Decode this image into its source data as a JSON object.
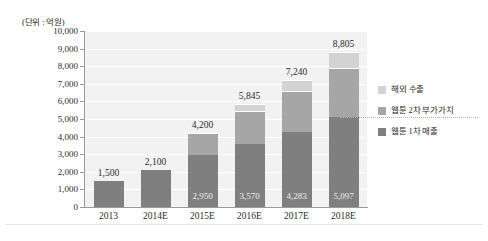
{
  "unit_label": "(단위 : 억원)",
  "chart_data": {
    "type": "bar",
    "subtype": "stacked-bar",
    "title": "",
    "subtitle": "",
    "xlabel": "",
    "ylabel": "",
    "unit_note": "(단위 : 억원)",
    "categories": [
      "2013",
      "2014E",
      "2015E",
      "2016E",
      "2017E",
      "2018E"
    ],
    "ylim": [
      0,
      10000
    ],
    "ytick_labels": [
      "10,000",
      "9,000",
      "8,000",
      "7,000",
      "6,000",
      "5,000",
      "4,000",
      "3,000",
      "2,000",
      "1,000",
      "0"
    ],
    "ytick_values": [
      10000,
      9000,
      8000,
      7000,
      6000,
      5000,
      4000,
      3000,
      2000,
      1000,
      0
    ],
    "grid": true,
    "grid_color": "#ffffff",
    "plot_background": "#f2f2f2",
    "legend_position": "right",
    "series": [
      {
        "name": "웹툰 1차 매출",
        "color": "#7f7f7f",
        "values": [
          1500,
          2100,
          2950,
          3570,
          4283,
          5097
        ],
        "value_labels": [
          "",
          "",
          "2,950",
          "3,570",
          "4,283",
          "5,097"
        ]
      },
      {
        "name": "웹툰 2차 부가가치",
        "color": "#a6a6a6",
        "values": [
          0,
          0,
          1250,
          1860,
          2307,
          2808
        ],
        "value_labels": [
          "",
          "",
          "",
          "",
          "",
          ""
        ]
      },
      {
        "name": "해외 수출",
        "color": "#d3d3d3",
        "values": [
          0,
          0,
          0,
          415,
          650,
          900
        ],
        "value_labels": [
          "",
          "",
          "",
          "",
          "",
          ""
        ]
      }
    ],
    "totals": [
      1500,
      2100,
      4200,
      5845,
      7240,
      8805
    ],
    "total_labels": [
      "1,500",
      "2,100",
      "4,200",
      "5,845",
      "7,240",
      "8,805"
    ]
  },
  "legend": {
    "items": [
      {
        "label": "해외 수출",
        "color": "#d3d3d3"
      },
      {
        "label": "웹툰 2차 부가가치",
        "color": "#a6a6a6"
      },
      {
        "label": "웹툰 1차 매출",
        "color": "#7f7f7f"
      }
    ]
  }
}
